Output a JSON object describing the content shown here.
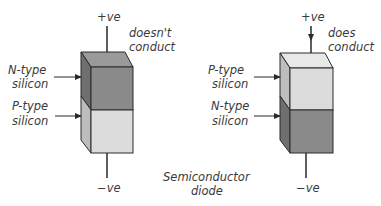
{
  "diagram": {
    "caption_lines": [
      "Semiconductor",
      "diode"
    ],
    "colors": {
      "n_type": "#8a8a8a",
      "n_type_side": "#6f6f6f",
      "n_type_top": "#9a9a9a",
      "p_type": "#dcdcdc",
      "p_type_side": "#bdbdbd",
      "p_type_top": "#e8e8e8",
      "outline": "#2a2a2a",
      "text": "#3a3a3a"
    },
    "left": {
      "top_terminal": "+ve",
      "bottom_terminal": "−ve",
      "status_lines": [
        "doesn't",
        "conduct"
      ],
      "top_layer": {
        "label_lines": [
          "N-type",
          "silicon"
        ],
        "type": "N"
      },
      "bottom_layer": {
        "label_lines": [
          "P-type",
          "silicon"
        ],
        "type": "P"
      }
    },
    "right": {
      "top_terminal": "+ve",
      "bottom_terminal": "−ve",
      "status_lines": [
        "does",
        "conduct"
      ],
      "top_layer": {
        "label_lines": [
          "P-type",
          "silicon"
        ],
        "type": "P"
      },
      "bottom_layer": {
        "label_lines": [
          "N-type",
          "silicon"
        ],
        "type": "N"
      }
    }
  }
}
